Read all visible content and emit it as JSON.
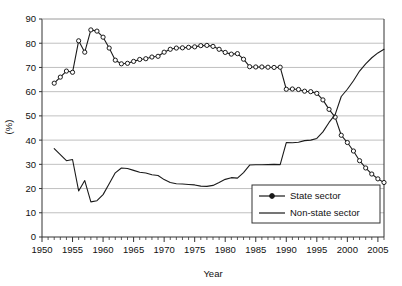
{
  "chart_data": {
    "type": "line",
    "title": "",
    "xlabel": "Year",
    "ylabel": "(%)",
    "xlim": [
      1950,
      2006
    ],
    "ylim": [
      0,
      90
    ],
    "ytick_step": 10,
    "xtick_step": 5,
    "xticks": [
      "1950",
      "1955",
      "1960",
      "1965",
      "1970",
      "1975",
      "1980",
      "1985",
      "1990",
      "1995",
      "2000",
      "2005"
    ],
    "yticks": [
      "0",
      "10",
      "20",
      "30",
      "40",
      "50",
      "60",
      "70",
      "80",
      "90"
    ],
    "minor_xticks": "every 1 year",
    "grid": "horizontal",
    "legend_position": "bottom-right inside plot",
    "x": [
      1952,
      1953,
      1954,
      1955,
      1956,
      1957,
      1958,
      1959,
      1960,
      1961,
      1962,
      1963,
      1964,
      1965,
      1966,
      1967,
      1968,
      1969,
      1970,
      1971,
      1972,
      1973,
      1974,
      1975,
      1976,
      1977,
      1978,
      1979,
      1980,
      1981,
      1982,
      1983,
      1984,
      1985,
      1986,
      1987,
      1988,
      1989,
      1990,
      1991,
      1992,
      1993,
      1994,
      1995,
      1996,
      1997,
      1998,
      1999,
      2000,
      2001,
      2002,
      2003,
      2004,
      2005,
      2006
    ],
    "series": [
      {
        "name": "State sector",
        "marker": "circle",
        "color": "#1a1a1a",
        "values": [
          63.5,
          66.0,
          68.5,
          68.0,
          81.0,
          76.3,
          85.5,
          85.0,
          82.5,
          78.0,
          73.0,
          71.5,
          71.7,
          72.5,
          73.3,
          73.6,
          74.3,
          74.6,
          76.3,
          77.5,
          78.0,
          78.1,
          78.3,
          78.5,
          79.0,
          79.1,
          78.7,
          77.5,
          76.2,
          75.5,
          75.7,
          73.4,
          70.3,
          70.2,
          70.2,
          70.1,
          70.0,
          70.1,
          61.0,
          61.1,
          60.9,
          60.2,
          60.0,
          59.3,
          56.6,
          52.7,
          49.5,
          42.0,
          39.0,
          35.5,
          31.5,
          28.5,
          26.0,
          24.0,
          22.5
        ]
      },
      {
        "name": "Non-state sector",
        "marker": "none",
        "color": "#1a1a1a",
        "values": [
          36.5,
          34.0,
          31.5,
          32.0,
          19.0,
          23.3,
          14.5,
          15.0,
          17.5,
          22.0,
          26.5,
          28.5,
          28.3,
          27.5,
          26.7,
          26.4,
          25.7,
          25.4,
          23.7,
          22.5,
          22.0,
          21.9,
          21.7,
          21.5,
          21.0,
          20.9,
          21.3,
          22.5,
          23.8,
          24.5,
          24.3,
          26.6,
          29.7,
          29.8,
          29.8,
          29.9,
          30.0,
          29.9,
          39.0,
          38.9,
          39.1,
          39.8,
          40.0,
          40.7,
          43.4,
          47.3,
          50.5,
          58.0,
          61.0,
          64.5,
          68.5,
          71.5,
          74.0,
          76.0,
          77.5
        ]
      }
    ]
  },
  "legend": {
    "items": [
      {
        "label": "State sector",
        "style": "line-with-marker"
      },
      {
        "label": "Non-state sector",
        "style": "line"
      }
    ]
  },
  "axes": {
    "x_title": "Year",
    "y_title": "(%)"
  }
}
